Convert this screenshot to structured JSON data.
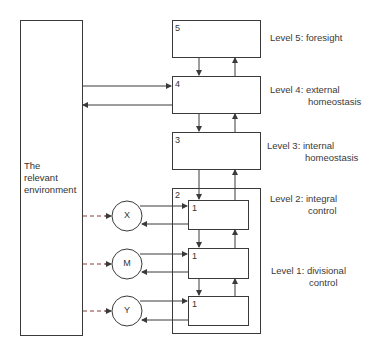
{
  "diagram": {
    "environment": {
      "line1": "The",
      "line2": "relevant",
      "line3": "environment"
    },
    "boxes": {
      "b5": "5",
      "b4": "4",
      "b3": "3",
      "b2": "2",
      "s1a": "1",
      "s1b": "1",
      "s1c": "1"
    },
    "circles": {
      "x": "X",
      "m": "M",
      "y": "Y"
    },
    "levels": [
      {
        "line1": "Level 5:  foresight",
        "line2": ""
      },
      {
        "line1": "Level 4:  external",
        "line2": "homeostasis"
      },
      {
        "line1": "Level 3:  internal",
        "line2": "homeostasis"
      },
      {
        "line1": "Level 2:  integral",
        "line2": "control"
      },
      {
        "line1": "Level 1:  divisional",
        "line2": "control"
      }
    ],
    "colors": {
      "line": "#3a3a3a",
      "dash": "#8a3a3a"
    }
  }
}
